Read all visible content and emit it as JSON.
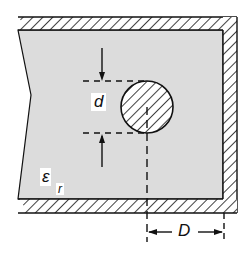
{
  "diagram": {
    "labels": {
      "diameter": "d",
      "permittivity_symbol": "ε",
      "permittivity_subscript": "r",
      "distance": "D"
    },
    "colors": {
      "dielectric_fill": "#dcdcdc",
      "line": "#111111",
      "background": "#ffffff"
    }
  }
}
